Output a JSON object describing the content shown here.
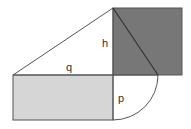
{
  "diagram": {
    "colors": {
      "background": "#ffffff",
      "dark_square": "#777777",
      "light_rectangle": "#d6d6d6",
      "stroke": "#555555"
    },
    "labels": {
      "h": "h",
      "q": "q",
      "p": "p"
    },
    "shapes": {
      "dark_square": {
        "x": 113,
        "y": 8,
        "w": 69,
        "h": 67
      },
      "light_rectangle": {
        "x": 13,
        "y": 75,
        "w": 100,
        "h": 45
      },
      "triangle": {
        "points": [
          [
            13,
            75
          ],
          [
            113,
            8
          ],
          [
            158,
            75
          ]
        ]
      },
      "quarter_arc": {
        "center": [
          113,
          75
        ],
        "radius": 45
      }
    }
  }
}
